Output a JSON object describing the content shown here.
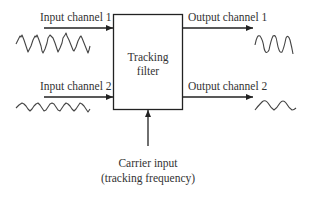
{
  "diagram": {
    "block": {
      "label_line1": "Tracking",
      "label_line2": "filter"
    },
    "inputs": [
      {
        "label": "Input channel 1",
        "waveform": "noisy-sine-high-amplitude"
      },
      {
        "label": "Input channel 2",
        "waveform": "noisy-sine-low-amplitude"
      }
    ],
    "outputs": [
      {
        "label": "Output channel 1",
        "waveform": "clean-sine-high-amplitude"
      },
      {
        "label": "Output channel 2",
        "waveform": "clean-sine-low-amplitude"
      }
    ],
    "carrier": {
      "label_line1": "Carrier input",
      "label_line2": "(tracking frequency)"
    },
    "colors": {
      "line": "#222222",
      "text": "#333333",
      "wave": "#444444",
      "background": "#ffffff"
    }
  }
}
